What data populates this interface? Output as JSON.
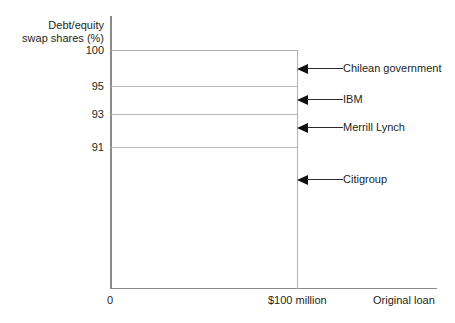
{
  "chart_data": {
    "type": "bar",
    "title": "",
    "subtitle": "",
    "xlabel": "Original loan",
    "ylabel": "Debt/equity\nswap shares (%)",
    "ylim": [
      0,
      100
    ],
    "xlim": [
      0,
      100
    ],
    "grid": true,
    "legend_position": "right-annotations",
    "y_ticks": [
      {
        "label": "100",
        "value": 100
      },
      {
        "label": "95",
        "value": 95
      },
      {
        "label": "93",
        "value": 93
      },
      {
        "label": "91",
        "value": 91
      }
    ],
    "x_ticks": [
      {
        "label": "0",
        "value": 0
      },
      {
        "label": "$100 million",
        "value": 100
      }
    ],
    "categories": [
      "Chilean government",
      "IBM",
      "Merrill Lynch",
      "Citigroup"
    ],
    "series": [
      {
        "name": "Debt/equity swap shares (%)",
        "values": [
          5,
          2,
          2,
          91
        ]
      }
    ],
    "segments": [
      {
        "name": "Chilean government",
        "from": 95,
        "to": 100,
        "share": 5
      },
      {
        "name": "IBM",
        "from": 93,
        "to": 95,
        "share": 2
      },
      {
        "name": "Merrill Lynch",
        "from": 91,
        "to": 93,
        "share": 2
      },
      {
        "name": "Citigroup",
        "from": 0,
        "to": 91,
        "share": 91
      }
    ],
    "annotations": [
      {
        "label": "Chilean government",
        "top": 62
      },
      {
        "label": "IBM",
        "top": 93
      },
      {
        "label": "Merrill Lynch",
        "top": 121
      },
      {
        "label": "Citigroup",
        "top": 173
      }
    ],
    "level_lines": [
      {
        "value": 100,
        "top": 50
      },
      {
        "value": 95,
        "top": 86
      },
      {
        "value": 93,
        "top": 114
      },
      {
        "value": 91,
        "top": 147
      }
    ],
    "tick_label_positions": [
      {
        "label": "100",
        "top": 45
      },
      {
        "label": "95",
        "top": 81
      },
      {
        "label": "93",
        "top": 109
      },
      {
        "label": "91",
        "top": 142
      }
    ],
    "colors": {
      "axis": "#8a8a8a",
      "gridline": "#b9b9b9",
      "text": "#231f20",
      "arrow": "#111111",
      "background": "#ffffff"
    }
  }
}
